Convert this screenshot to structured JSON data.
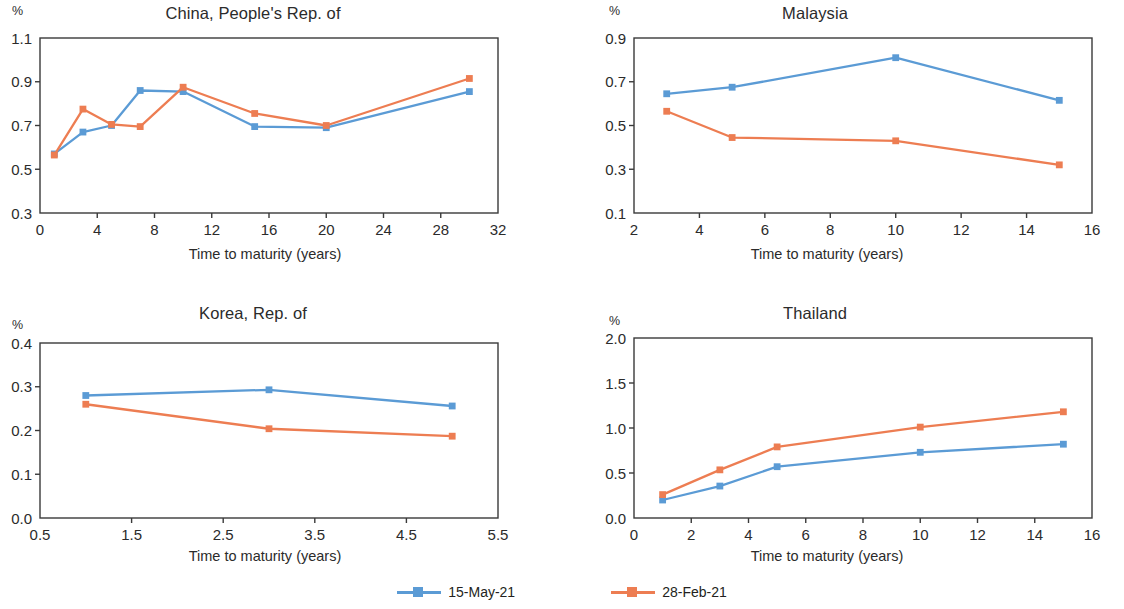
{
  "series_colors": {
    "series_1": "#5B9BD5",
    "series_2": "#ED7D52"
  },
  "legend": {
    "position": "bottom-center",
    "items": [
      {
        "label": "15-May-21",
        "color": "#5B9BD5"
      },
      {
        "label": "28-Feb-21",
        "color": "#ED7D52"
      }
    ]
  },
  "common": {
    "unit_label": "%",
    "xlabel": "Time to maturity (years)"
  },
  "chart_data": [
    {
      "type": "line",
      "title": "China, People's Rep. of",
      "xlabel": "Time to maturity (years)",
      "ylabel": "%",
      "xlim": [
        0,
        32
      ],
      "ylim": [
        0.3,
        1.1
      ],
      "xticks": [
        0,
        4,
        8,
        12,
        16,
        20,
        24,
        28,
        32
      ],
      "xticklabels": [
        "0",
        "4",
        "8",
        "12",
        "16",
        "20",
        "24",
        "28",
        "32"
      ],
      "yticks": [
        0.3,
        0.5,
        0.7,
        0.9,
        1.1
      ],
      "yticklabels": [
        "0.3",
        "0.5",
        "0.7",
        "0.9",
        "1.1"
      ],
      "grid": false,
      "x": [
        1,
        3,
        5,
        7,
        10,
        15,
        20,
        30
      ],
      "series": [
        {
          "name": "15-May-21",
          "color": "#5B9BD5",
          "values": [
            0.57,
            0.67,
            0.7,
            0.86,
            0.855,
            0.695,
            0.69,
            0.855
          ]
        },
        {
          "name": "28-Feb-21",
          "color": "#ED7D52",
          "values": [
            0.565,
            0.775,
            0.705,
            0.695,
            0.875,
            0.755,
            0.7,
            0.915
          ]
        }
      ]
    },
    {
      "type": "line",
      "title": "Malaysia",
      "xlabel": "Time to maturity (years)",
      "ylabel": "%",
      "xlim": [
        2,
        16
      ],
      "ylim": [
        0.1,
        0.9
      ],
      "xticks": [
        2,
        4,
        6,
        8,
        10,
        12,
        14,
        16
      ],
      "xticklabels": [
        "2",
        "4",
        "6",
        "8",
        "10",
        "12",
        "14",
        "16"
      ],
      "yticks": [
        0.1,
        0.3,
        0.5,
        0.7,
        0.9
      ],
      "yticklabels": [
        "0.1",
        "0.3",
        "0.5",
        "0.7",
        "0.9"
      ],
      "grid": false,
      "x": [
        3,
        5,
        10,
        15
      ],
      "series": [
        {
          "name": "15-May-21",
          "color": "#5B9BD5",
          "values": [
            0.645,
            0.675,
            0.81,
            0.615
          ]
        },
        {
          "name": "28-Feb-21",
          "color": "#ED7D52",
          "values": [
            0.565,
            0.445,
            0.43,
            0.32
          ]
        }
      ]
    },
    {
      "type": "line",
      "title": "Korea, Rep. of",
      "xlabel": "Time to maturity (years)",
      "ylabel": "%",
      "xlim": [
        0.5,
        5.5
      ],
      "ylim": [
        0.0,
        0.4
      ],
      "xticks": [
        0.5,
        1.5,
        2.5,
        3.5,
        4.5,
        5.5
      ],
      "xticklabels": [
        "0.5",
        "1.5",
        "2.5",
        "3.5",
        "4.5",
        "5.5"
      ],
      "yticks": [
        0.0,
        0.1,
        0.2,
        0.3,
        0.4
      ],
      "yticklabels": [
        "0.0",
        "0.1",
        "0.2",
        "0.3",
        "0.4"
      ],
      "grid": false,
      "x": [
        1,
        3,
        5
      ],
      "series": [
        {
          "name": "15-May-21",
          "color": "#5B9BD5",
          "values": [
            0.28,
            0.293,
            0.256
          ]
        },
        {
          "name": "28-Feb-21",
          "color": "#ED7D52",
          "values": [
            0.26,
            0.204,
            0.187
          ]
        }
      ]
    },
    {
      "type": "line",
      "title": "Thailand",
      "xlabel": "Time to maturity (years)",
      "ylabel": "%",
      "xlim": [
        0,
        16
      ],
      "ylim": [
        0.0,
        2.0
      ],
      "xticks": [
        0,
        2,
        4,
        6,
        8,
        10,
        12,
        14,
        16
      ],
      "xticklabels": [
        "0",
        "2",
        "4",
        "6",
        "8",
        "10",
        "12",
        "14",
        "16"
      ],
      "yticks": [
        0.0,
        0.5,
        1.0,
        1.5,
        2.0
      ],
      "yticklabels": [
        "0.0",
        "0.5",
        "1.0",
        "1.5",
        "2.0"
      ],
      "grid": false,
      "x": [
        1,
        3,
        5,
        10,
        15
      ],
      "series": [
        {
          "name": "15-May-21",
          "color": "#5B9BD5",
          "values": [
            0.2,
            0.355,
            0.57,
            0.73,
            0.82
          ]
        },
        {
          "name": "28-Feb-21",
          "color": "#ED7D52",
          "values": [
            0.26,
            0.535,
            0.79,
            1.01,
            1.18
          ]
        }
      ]
    }
  ]
}
